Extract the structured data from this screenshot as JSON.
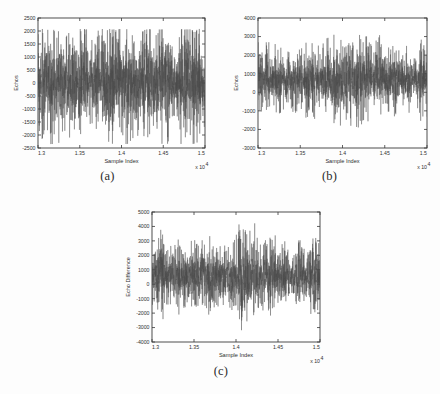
{
  "figure": {
    "background_color": "#fdfdfd",
    "trace_color": "#4a4a4a",
    "axis_color": "#3a3a3a"
  },
  "panels": [
    {
      "id": "a",
      "caption": "(a)",
      "xlabel": "Sample Index",
      "ylabel": "Echos",
      "exponent_label": "x 10",
      "exponent_sup": "4"
    },
    {
      "id": "b",
      "caption": "(b)",
      "xlabel": "Sample Index",
      "ylabel": "Echos",
      "exponent_label": "x 10",
      "exponent_sup": "4"
    },
    {
      "id": "c",
      "caption": "(c)",
      "xlabel": "Sample Index",
      "ylabel": "Echo Difference",
      "exponent_label": "x 10",
      "exponent_sup": "4"
    }
  ],
  "chart_data": [
    {
      "panel": "a",
      "type": "line",
      "title": "",
      "xlabel": "Sample Index",
      "ylabel": "Echos",
      "xlim": [
        13000,
        15000
      ],
      "ylim": [
        -2500,
        2500
      ],
      "xticks": [
        13000,
        13500,
        14000,
        14500,
        15000
      ],
      "xticklabels": [
        "1.3",
        "1.35",
        "1.4",
        "1.45",
        "1.5"
      ],
      "x_exponent": "x 10^4",
      "yticks": [
        -2500,
        -2000,
        -1500,
        -1000,
        -500,
        0,
        500,
        1000,
        1500,
        2000,
        2500
      ],
      "yticklabels": [
        "-2500",
        "-2000",
        "-1500",
        "-1000",
        "-500",
        "0",
        "500",
        "1000",
        "1500",
        "2000",
        "2500"
      ],
      "grid": false,
      "legend": null,
      "series": [
        {
          "name": "echos",
          "description": "Dense oscillatory echo waveform, zero-mean, envelope roughly +/-2100 with isolated spikes reaching +2050 and -2350.",
          "mean": 0,
          "noise_std": 620,
          "spike_rate": 0.16,
          "spike_amplitude": 1900,
          "n_points": 2000,
          "seed": 1307,
          "y_min_observed": -2350,
          "y_max_observed": 2080
        }
      ]
    },
    {
      "panel": "b",
      "type": "line",
      "title": "",
      "xlabel": "Sample Index",
      "ylabel": "Echos",
      "xlim": [
        13000,
        15000
      ],
      "ylim": [
        -3000,
        4000
      ],
      "xticks": [
        13000,
        13500,
        14000,
        14500,
        15000
      ],
      "xticklabels": [
        "1.3",
        "1.35",
        "1.4",
        "1.45",
        "1.5"
      ],
      "x_exponent": "x 10^4",
      "yticks": [
        -3000,
        -2000,
        -1000,
        0,
        1000,
        2000,
        3000,
        4000
      ],
      "yticklabels": [
        "-3000",
        "-2000",
        "-1000",
        "0",
        "1000",
        "2000",
        "3000",
        "4000"
      ],
      "grid": false,
      "legend": null,
      "series": [
        {
          "name": "echos",
          "description": "Echo waveform with positive DC offset near +700, spikes up to +3100 and down to -2600.",
          "mean": 700,
          "noise_std": 600,
          "spike_rate": 0.14,
          "spike_amplitude": 1850,
          "n_points": 2000,
          "seed": 2207,
          "y_min_observed": -2620,
          "y_max_observed": 3120
        }
      ]
    },
    {
      "panel": "c",
      "type": "line",
      "title": "",
      "xlabel": "Sample Index",
      "ylabel": "Echo Difference",
      "xlim": [
        13000,
        15000
      ],
      "ylim": [
        -4000,
        5000
      ],
      "xticks": [
        13000,
        13500,
        14000,
        14500,
        15000
      ],
      "xticklabels": [
        "1.3",
        "1.35",
        "1.4",
        "1.45",
        "1.5"
      ],
      "x_exponent": "x 10^4",
      "yticks": [
        -4000,
        -3000,
        -2000,
        -1000,
        0,
        1000,
        2000,
        3000,
        4000,
        5000
      ],
      "yticklabels": [
        "-4000",
        "-3000",
        "-2000",
        "-1000",
        "0",
        "1000",
        "2000",
        "3000",
        "4000",
        "5000"
      ],
      "grid": false,
      "legend": null,
      "series": [
        {
          "name": "echo-difference",
          "description": "Difference of the two echo traces, positive mean near +600, largest early excursions +4400 and -3700.",
          "mean": 600,
          "noise_std": 760,
          "spike_rate": 0.17,
          "spike_amplitude": 2200,
          "n_points": 2000,
          "seed": 3301,
          "y_min_observed": -3700,
          "y_max_observed": 4420
        }
      ]
    }
  ]
}
